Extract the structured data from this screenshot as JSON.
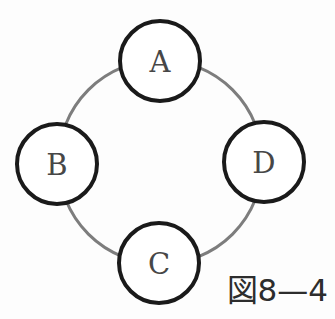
{
  "figure": {
    "type": "cycle-diagram",
    "caption": "図8—4",
    "nodes": [
      {
        "id": "A",
        "label": "A",
        "position": "top"
      },
      {
        "id": "B",
        "label": "B",
        "position": "left"
      },
      {
        "id": "C",
        "label": "C",
        "position": "bottom"
      },
      {
        "id": "D",
        "label": "D",
        "position": "right"
      }
    ],
    "connections": [
      [
        "A",
        "D"
      ],
      [
        "D",
        "C"
      ],
      [
        "C",
        "B"
      ],
      [
        "B",
        "A"
      ]
    ],
    "colors": {
      "background": "#fdfdfd",
      "node_fill": "#ffffff",
      "node_stroke": "#1a1a1a",
      "ring_stroke": "#7d7d7d",
      "label_color": "#474747",
      "caption_color": "#2d2d2d"
    }
  }
}
